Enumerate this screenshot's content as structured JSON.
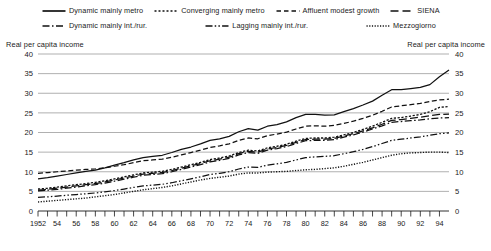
{
  "chart_data": {
    "type": "line",
    "title": "",
    "subtitle": "",
    "xlabel": "",
    "ylabel": "Real per capita income",
    "ylabel_right": "Real per capita income",
    "ylim": [
      0,
      40
    ],
    "ytick_labels": [
      "0",
      "5",
      "10",
      "15",
      "20",
      "25",
      "30",
      "35",
      "40"
    ],
    "ytick_values": [
      0,
      5,
      10,
      15,
      20,
      25,
      30,
      35,
      40
    ],
    "xlim": [
      1952,
      1995
    ],
    "xtick_labels": [
      "1952",
      "54",
      "56",
      "58",
      "60",
      "62",
      "64",
      "66",
      "68",
      "70",
      "72",
      "74",
      "76",
      "78",
      "80",
      "82",
      "84",
      "86",
      "88",
      "90",
      "92",
      "94"
    ],
    "xtick_values": [
      1952,
      1954,
      1956,
      1958,
      1960,
      1962,
      1964,
      1966,
      1968,
      1970,
      1972,
      1974,
      1976,
      1978,
      1980,
      1982,
      1984,
      1986,
      1988,
      1990,
      1992,
      1994
    ],
    "x": [
      1952,
      1953,
      1954,
      1955,
      1956,
      1957,
      1958,
      1959,
      1960,
      1961,
      1962,
      1963,
      1964,
      1965,
      1966,
      1967,
      1968,
      1969,
      1970,
      1971,
      1972,
      1973,
      1974,
      1975,
      1976,
      1977,
      1978,
      1979,
      1980,
      1981,
      1982,
      1983,
      1984,
      1985,
      1986,
      1987,
      1988,
      1989,
      1990,
      1991,
      1992,
      1993,
      1994,
      1995
    ],
    "grid": true,
    "grid_axis": "y",
    "legend_position": "top",
    "series": [
      {
        "name": "Dynamic mainly metro",
        "style": "solid",
        "values": [
          8.2,
          8.5,
          8.9,
          9.3,
          9.7,
          10.1,
          10.4,
          11.0,
          11.7,
          12.3,
          13.0,
          13.6,
          13.9,
          14.2,
          14.9,
          15.7,
          16.3,
          17.1,
          18.0,
          18.4,
          19.0,
          20.2,
          21.0,
          20.6,
          21.6,
          22.0,
          22.7,
          23.8,
          24.6,
          24.6,
          24.4,
          24.5,
          25.3,
          26.1,
          27.0,
          28.0,
          29.5,
          30.9,
          30.9,
          31.2,
          31.5,
          32.2,
          34.2,
          35.9
        ]
      },
      {
        "name": "Converging mainly metro",
        "style": "dotted",
        "values": [
          5.6,
          5.8,
          6.1,
          6.4,
          6.7,
          7.0,
          7.3,
          7.7,
          8.2,
          8.7,
          9.2,
          9.7,
          9.9,
          10.1,
          10.6,
          11.2,
          11.8,
          12.4,
          13.1,
          13.5,
          14.0,
          14.9,
          15.5,
          15.3,
          16.1,
          16.5,
          17.0,
          17.8,
          18.5,
          18.6,
          18.6,
          18.8,
          19.4,
          20.0,
          20.8,
          21.6,
          22.6,
          23.6,
          23.8,
          24.2,
          24.6,
          25.3,
          26.4,
          26.6
        ]
      },
      {
        "name": "Affluent modest growth",
        "style": "dashed",
        "values": [
          9.6,
          9.8,
          10.0,
          10.2,
          10.4,
          10.6,
          10.7,
          11.0,
          11.4,
          11.8,
          12.3,
          12.8,
          13.0,
          13.2,
          13.7,
          14.3,
          14.9,
          15.5,
          16.2,
          16.6,
          17.1,
          18.0,
          18.6,
          18.4,
          19.2,
          19.6,
          20.1,
          20.9,
          21.6,
          21.7,
          21.6,
          21.8,
          22.3,
          22.9,
          23.6,
          24.4,
          25.4,
          26.5,
          26.8,
          27.1,
          27.4,
          27.9,
          28.3,
          28.5
        ]
      },
      {
        "name": "SIENA",
        "style": "longdash",
        "values": [
          5.3,
          5.5,
          5.8,
          6.1,
          6.4,
          6.7,
          7.0,
          7.4,
          7.9,
          8.4,
          8.9,
          9.4,
          9.6,
          9.8,
          10.3,
          10.9,
          11.5,
          12.1,
          12.8,
          13.2,
          13.7,
          14.6,
          15.2,
          15.0,
          15.8,
          16.2,
          16.7,
          17.5,
          18.2,
          18.3,
          18.3,
          18.5,
          19.1,
          19.7,
          20.4,
          21.2,
          22.1,
          23.1,
          23.3,
          23.6,
          23.9,
          24.3,
          24.6,
          24.7
        ]
      },
      {
        "name": "Dynamic mainly int./rur.",
        "style": "dashdot",
        "values": [
          5.1,
          5.3,
          5.5,
          5.8,
          6.1,
          6.4,
          6.7,
          7.1,
          7.6,
          8.1,
          8.6,
          9.1,
          9.3,
          9.5,
          10.0,
          10.6,
          11.2,
          11.8,
          12.5,
          12.9,
          13.4,
          14.3,
          14.9,
          14.7,
          15.5,
          15.9,
          16.4,
          17.2,
          17.9,
          18.0,
          18.0,
          18.2,
          18.8,
          19.4,
          20.1,
          20.9,
          21.7,
          22.6,
          22.8,
          23.0,
          23.2,
          23.5,
          23.7,
          23.8
        ]
      },
      {
        "name": "Lagging mainly int./rur.",
        "style": "dashdotdot",
        "values": [
          3.5,
          3.6,
          3.8,
          4.0,
          4.2,
          4.4,
          4.6,
          4.9,
          5.2,
          5.6,
          6.0,
          6.4,
          6.6,
          6.8,
          7.2,
          7.7,
          8.2,
          8.7,
          9.3,
          9.6,
          10.0,
          10.7,
          11.2,
          11.1,
          11.7,
          12.0,
          12.4,
          13.0,
          13.6,
          13.8,
          13.9,
          14.1,
          14.6,
          15.1,
          15.7,
          16.4,
          17.2,
          18.0,
          18.3,
          18.6,
          18.9,
          19.3,
          19.7,
          19.9
        ]
      },
      {
        "name": "Mezzogiorno",
        "style": "finedot",
        "values": [
          2.3,
          2.5,
          2.7,
          2.9,
          3.1,
          3.3,
          3.6,
          3.9,
          4.2,
          4.6,
          5.0,
          5.4,
          5.7,
          6.0,
          6.4,
          6.9,
          7.4,
          7.9,
          8.3,
          8.6,
          8.9,
          9.4,
          9.7,
          9.7,
          9.9,
          10.0,
          10.1,
          10.3,
          10.5,
          10.6,
          10.8,
          11.0,
          11.4,
          11.9,
          12.4,
          13.0,
          13.6,
          14.2,
          14.6,
          14.8,
          14.9,
          15.0,
          15.0,
          14.9
        ]
      }
    ]
  },
  "legend": {
    "row1": [
      {
        "label": "Dynamic mainly metro",
        "style": "solid"
      },
      {
        "label": "Converging mainly metro",
        "style": "dotted"
      },
      {
        "label": "Affluent modest growth",
        "style": "dashed"
      },
      {
        "label": "SIENA",
        "style": "longdash"
      }
    ],
    "row2": [
      {
        "label": "Dynamic mainly int./rur.",
        "style": "dashdot"
      },
      {
        "label": "Lagging mainly int./rur.",
        "style": "dashdotdot"
      },
      {
        "label": "Mezzogiorno",
        "style": "finedot"
      }
    ]
  },
  "captions": {
    "left": "Real per capita income",
    "right": "Real per capita income"
  },
  "colors": {
    "line": "#111111",
    "grid": "#8e8e8e",
    "axis": "#1a1a1a",
    "background": "#ffffff"
  }
}
